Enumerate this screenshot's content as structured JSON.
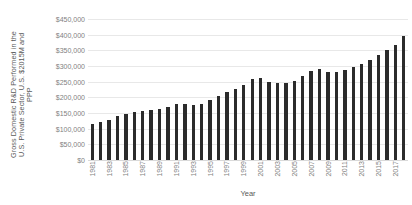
{
  "chart_data": {
    "type": "bar",
    "title": "",
    "xlabel": "Year",
    "ylabel": "Gross Domestic R&D Performed in the U.S. Private Sector, U.S. $2015M and PPP",
    "ylabel_lines": [
      "Gross Domestic R&D Performed in the",
      "U.S. Private Sector, U.S. $2015M and",
      "PPP"
    ],
    "ylim": [
      0,
      450000
    ],
    "y_tick_values": [
      0,
      50000,
      100000,
      150000,
      200000,
      250000,
      300000,
      350000,
      400000,
      450000
    ],
    "y_tick_labels": [
      "$0",
      "$50,000",
      "$100,000",
      "$150,000",
      "$200,000",
      "$250,000",
      "$300,000",
      "$350,000",
      "$400,000",
      "$450,000"
    ],
    "grid": true,
    "grid_axis": "y",
    "legend": false,
    "bar_color": "#2b2b2b",
    "gridline_color": "#e8e8e8",
    "tick_label_color": "#7f7f7f",
    "axis_title_color": "#595959",
    "x_tick_label_rotation": 90,
    "x_tick_label_interval": 2,
    "categories": [
      "1981",
      "1982",
      "1983",
      "1984",
      "1985",
      "1986",
      "1987",
      "1988",
      "1989",
      "1990",
      "1991",
      "1992",
      "1993",
      "1994",
      "1995",
      "1996",
      "1997",
      "1998",
      "1999",
      "2000",
      "2001",
      "2002",
      "2003",
      "2004",
      "2005",
      "2006",
      "2007",
      "2008",
      "2009",
      "2010",
      "2011",
      "2012",
      "2013",
      "2014",
      "2015",
      "2016",
      "2017",
      "2018"
    ],
    "x_tick_labels_shown": [
      "1981",
      "1983",
      "1985",
      "1987",
      "1989",
      "1991",
      "1993",
      "1995",
      "1997",
      "1999",
      "2001",
      "2003",
      "2005",
      "2007",
      "2009",
      "2011",
      "2013",
      "2015",
      "2017"
    ],
    "values": [
      114000,
      120000,
      128000,
      140000,
      148000,
      152000,
      155000,
      160000,
      163000,
      170000,
      178000,
      178000,
      176000,
      178000,
      192000,
      204000,
      216000,
      226000,
      240000,
      258000,
      262000,
      248000,
      246000,
      246000,
      252000,
      268000,
      284000,
      290000,
      282000,
      280000,
      288000,
      298000,
      306000,
      320000,
      336000,
      350000,
      368000,
      396000
    ]
  }
}
